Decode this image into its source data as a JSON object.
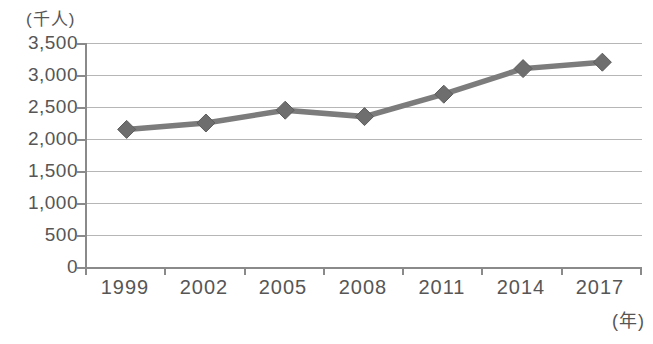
{
  "chart_data": {
    "type": "line",
    "title": "",
    "unit_y": "(千人)",
    "unit_x": "(年)",
    "xlabel": "年",
    "ylabel": "千人",
    "categories": [
      "1999",
      "2002",
      "2005",
      "2008",
      "2011",
      "2014",
      "2017"
    ],
    "series": [
      {
        "name": "series-1",
        "values": [
          2150,
          2250,
          2450,
          2350,
          2700,
          3100,
          3200
        ]
      }
    ],
    "ylim": [
      0,
      3500
    ],
    "ytick_step": 500,
    "ytick_labels": [
      "3,500",
      "3,000",
      "2,500",
      "2,000",
      "1,500",
      "1,000",
      "500",
      "0"
    ],
    "grid": true,
    "legend": "none",
    "marker": "diamond",
    "colors": {
      "line": "#7c7c7c",
      "marker_fill": "#6e6e6e",
      "marker_edge": "#5d5d5d",
      "grid": "#b6b6b6",
      "axis": "#8a8a8a",
      "text": "#565656",
      "background": "#ffffff"
    }
  }
}
